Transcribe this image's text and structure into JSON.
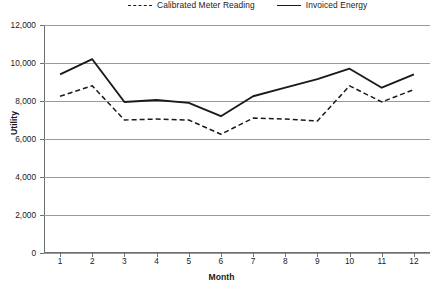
{
  "chart_data": {
    "type": "line",
    "title": "",
    "xlabel": "Month",
    "ylabel": "Utility",
    "categories": [
      "1",
      "2",
      "3",
      "4",
      "5",
      "6",
      "7",
      "8",
      "9",
      "10",
      "11",
      "12"
    ],
    "x": [
      1,
      2,
      3,
      4,
      5,
      6,
      7,
      8,
      9,
      10,
      11,
      12
    ],
    "xlim": [
      0.5,
      12.5
    ],
    "ylim": [
      0,
      12000
    ],
    "yticks": [
      0,
      2000,
      4000,
      6000,
      8000,
      10000,
      12000
    ],
    "ytick_labels": [
      "0",
      "2,000",
      "4,000",
      "6,000",
      "8,000",
      "10,000",
      "12,000"
    ],
    "grid": "horizontal",
    "legend_position": "top",
    "series": [
      {
        "name": "Calibrated Meter Reading",
        "style": "dashed",
        "color": "#1a1a1a",
        "values": [
          8250,
          8800,
          7000,
          7050,
          7000,
          6250,
          7100,
          7050,
          6950,
          8800,
          7950,
          8600
        ]
      },
      {
        "name": "Invoiced Energy",
        "style": "solid",
        "color": "#1a1a1a",
        "values": [
          9400,
          10200,
          7950,
          8050,
          7900,
          7200,
          8250,
          8700,
          9150,
          9700,
          8700,
          9400
        ]
      }
    ]
  },
  "legend": {
    "items": [
      {
        "label": "Calibrated Meter Reading",
        "style": "dashed"
      },
      {
        "label": "Invoiced Energy",
        "style": "solid"
      }
    ]
  },
  "axes": {
    "x_title": "Month",
    "y_title": "Utility"
  }
}
